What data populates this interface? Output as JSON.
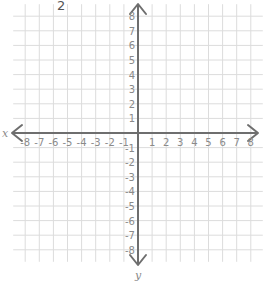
{
  "problem": {
    "number": "2"
  },
  "graph": {
    "x_axis_label": "x",
    "y_axis_label": "y",
    "x_range": [
      -8,
      8
    ],
    "y_range": [
      -8,
      8
    ],
    "grid_step": 1,
    "x_tick_labels": [
      "-8",
      "-7",
      "-6",
      "-5",
      "-4",
      "-3",
      "-2",
      "-1",
      "1",
      "2",
      "3",
      "4",
      "5",
      "6",
      "7",
      "8"
    ],
    "y_tick_labels": [
      "8",
      "7",
      "6",
      "5",
      "4",
      "3",
      "2",
      "1",
      "-1",
      "-2",
      "-3",
      "-4",
      "-5",
      "-6",
      "-7",
      "-8"
    ],
    "colors": {
      "grid": "#dcdcdc",
      "axis": "#6e6e6e",
      "labels": "#8a8a8a"
    }
  }
}
